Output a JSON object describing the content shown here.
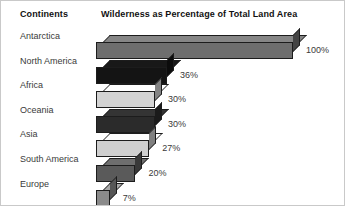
{
  "header": {
    "category_header": "Continents",
    "title": "Wilderness as Percentage of Total Land Area"
  },
  "chart_data": {
    "type": "bar",
    "title": "Wilderness as Percentage of Total Land Area",
    "xlabel": "",
    "ylabel": "Continents",
    "orientation": "horizontal",
    "grid": false,
    "legend": false,
    "xlim": [
      0,
      100
    ],
    "unit": "%",
    "categories": [
      "Antarctica",
      "North America",
      "Africa",
      "Oceania",
      "Asia",
      "South America",
      "Europe"
    ],
    "values": [
      100,
      36,
      30,
      30,
      27,
      20,
      7
    ],
    "value_labels": [
      "100%",
      "36%",
      "30%",
      "30%",
      "27%",
      "20%",
      "7%"
    ],
    "bar_colors": [
      "#6e6e6e",
      "#141414",
      "#d3d3d3",
      "#2b2b2b",
      "#cfcfcf",
      "#5a5a5a",
      "#8a8a8a"
    ]
  },
  "colors": {
    "background": "#ffffff",
    "text": "#3a3a3a",
    "heading": "#111111",
    "outline": "#1c1c1c",
    "border": "#c9c9c9"
  }
}
